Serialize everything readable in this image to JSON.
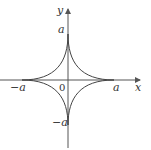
{
  "diagram": {
    "type": "astroid",
    "equation": "x^(2/3) + y^(2/3) = a^(2/3)",
    "axes": {
      "x_label": "x",
      "y_label": "y",
      "origin_label": "0"
    },
    "tick_labels": {
      "x_positive": "a",
      "x_negative": "−a",
      "y_positive": "a",
      "y_negative": "−a"
    },
    "colors": {
      "curve": "#444444",
      "axes": "#555555",
      "text": "#333333",
      "background": "#ffffff"
    }
  }
}
